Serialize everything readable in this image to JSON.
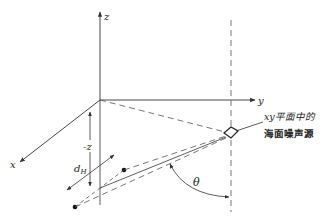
{
  "diagram": {
    "axes": {
      "z_label": "z",
      "y_label": "y",
      "x_label": "x"
    },
    "depth_label": "-z",
    "horizontal_distance_label": "d",
    "horizontal_distance_subscript": "H",
    "angle_label": "θ",
    "source_label_line1": "xy平面中的",
    "source_label_line2": "海面噪声源",
    "colors": {
      "line": "#333333",
      "dashed": "#555555",
      "background": "#ffffff"
    }
  }
}
